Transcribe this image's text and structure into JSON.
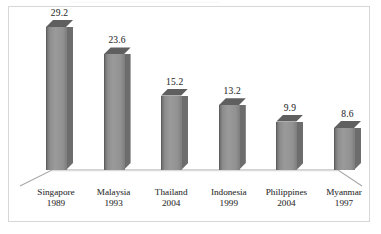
{
  "chart_data": {
    "type": "bar",
    "title": "",
    "subtitle": "",
    "xlabel": "",
    "ylabel": "",
    "categories": [
      "Singapore",
      "Malaysia",
      "Thailand",
      "Indonesia",
      "Philippines",
      "Myanmar"
    ],
    "years": [
      "1989",
      "1993",
      "2004",
      "1999",
      "2004",
      "1997"
    ],
    "values": [
      29.2,
      23.6,
      15.2,
      13.2,
      9.9,
      8.6
    ],
    "value_labels": [
      "29.2",
      "23.6",
      "15.2",
      "13.2",
      "9.9",
      "8.6"
    ],
    "ylim": [
      0,
      29.2
    ],
    "grid": false,
    "legend": false,
    "legend_position": "none",
    "axis_style": "3d-floor",
    "bar_style": "3d-column"
  },
  "colors": {
    "bar_front": "#9a9a9a",
    "bar_side": "#6d6d6d",
    "bar_top": "#5f5f5f",
    "bar_edge": "#5e5e5e",
    "frame_border": "#d7d7d7",
    "axis_line": "#a8a8a8",
    "text": "#3a3a3a",
    "background": "#ffffff"
  },
  "labels": {
    "bars": [
      {
        "category": "Singapore",
        "year": "1989",
        "value": "29.2"
      },
      {
        "category": "Malaysia",
        "year": "1993",
        "value": "23.6"
      },
      {
        "category": "Thailand",
        "year": "2004",
        "value": "15.2"
      },
      {
        "category": "Indonesia",
        "year": "1999",
        "value": "13.2"
      },
      {
        "category": "Philippines",
        "year": "2004",
        "value": "9.9"
      },
      {
        "category": "Myanmar",
        "year": "1997",
        "value": "8.6"
      }
    ]
  }
}
